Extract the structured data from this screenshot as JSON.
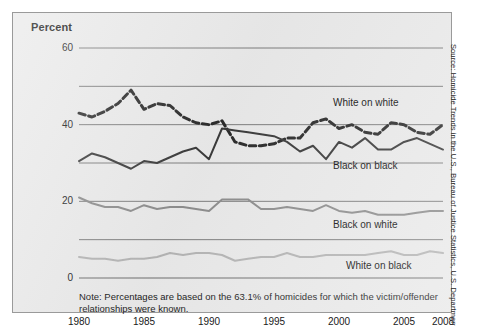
{
  "figure": {
    "axis_title": "Percent",
    "note": "Note: Percentages are based on the 63.1% of homicides for which the victim/offender relationships were known.",
    "source": "Source: Homicide Trends in the U.S., Bureau of Justice Statistics, U.S. Department of Justice.",
    "panel_bg": "#e9e9e9",
    "frame_color": "#9a9a9a"
  },
  "chart_data": {
    "type": "line",
    "title": "",
    "subtitle": "",
    "xlabel": "",
    "ylabel": "Percent",
    "xlim": [
      1980,
      2008
    ],
    "ylim": [
      0,
      60
    ],
    "grid": true,
    "gridlines_y": [
      0,
      10,
      20,
      30,
      40,
      50,
      60
    ],
    "y_tick_labels": [
      "0",
      "20",
      "40",
      "60"
    ],
    "y_tick_values": [
      0,
      20,
      40,
      60
    ],
    "x_tick_labels": [
      "1980",
      "1985",
      "1990",
      "1995",
      "2000",
      "2005",
      "2008"
    ],
    "x_tick_values": [
      1980,
      1985,
      1990,
      1995,
      2000,
      2005,
      2008
    ],
    "legend_position": "inline-right",
    "x": [
      1980,
      1981,
      1982,
      1983,
      1984,
      1985,
      1986,
      1987,
      1988,
      1989,
      1990,
      1991,
      1992,
      1993,
      1994,
      1995,
      1996,
      1997,
      1998,
      1999,
      2000,
      2001,
      2002,
      2003,
      2004,
      2005,
      2006,
      2007,
      2008
    ],
    "series": [
      {
        "name": "White on white",
        "style": "dashed",
        "color": "#2b2b2b",
        "values": [
          43.0,
          42.0,
          43.5,
          45.5,
          49.0,
          44.0,
          45.5,
          45.0,
          42.0,
          40.5,
          40.0,
          41.0,
          35.5,
          34.5,
          34.5,
          35.0,
          36.5,
          36.5,
          40.5,
          41.5,
          39.0,
          40.0,
          38.0,
          37.5,
          40.5,
          40.0,
          38.0,
          37.5,
          40.0
        ]
      },
      {
        "name": "Black on black",
        "style": "solid",
        "color": "#3a3a3a",
        "values": [
          30.5,
          32.5,
          31.5,
          30.0,
          28.5,
          30.5,
          30.0,
          31.5,
          33.0,
          34.0,
          31.0,
          39.0,
          38.5,
          38.0,
          37.5,
          37.0,
          35.5,
          33.0,
          34.5,
          31.0,
          35.5,
          34.0,
          36.5,
          33.5,
          33.5,
          35.5,
          36.5,
          35.0,
          33.5
        ]
      },
      {
        "name": "Black on white",
        "style": "solid",
        "color": "#8d8d8d",
        "values": [
          21.0,
          19.5,
          18.5,
          18.5,
          17.5,
          19.0,
          18.0,
          18.5,
          18.5,
          18.0,
          17.5,
          20.5,
          20.5,
          20.5,
          18.0,
          18.0,
          18.5,
          18.0,
          17.5,
          19.0,
          17.5,
          17.0,
          17.5,
          16.5,
          16.5,
          16.5,
          17.0,
          17.5,
          17.5
        ]
      },
      {
        "name": "White on black",
        "style": "solid",
        "color": "#b4b4b4",
        "values": [
          5.5,
          5.0,
          5.0,
          4.5,
          5.0,
          5.0,
          5.5,
          6.5,
          6.0,
          6.5,
          6.5,
          6.0,
          4.5,
          5.0,
          5.5,
          5.5,
          6.5,
          5.5,
          5.5,
          6.0,
          6.0,
          6.0,
          6.0,
          6.5,
          7.0,
          6.0,
          6.0,
          7.0,
          6.5
        ]
      }
    ],
    "annotations": [
      {
        "text": "White on white",
        "x": 2000,
        "y": 45.5
      },
      {
        "text": "Black on black",
        "x": 2000,
        "y": 29.0
      },
      {
        "text": "Black on white",
        "x": 2000,
        "y": 13.5
      },
      {
        "text": "White on black",
        "x": 2001,
        "y": 3.0
      }
    ]
  }
}
